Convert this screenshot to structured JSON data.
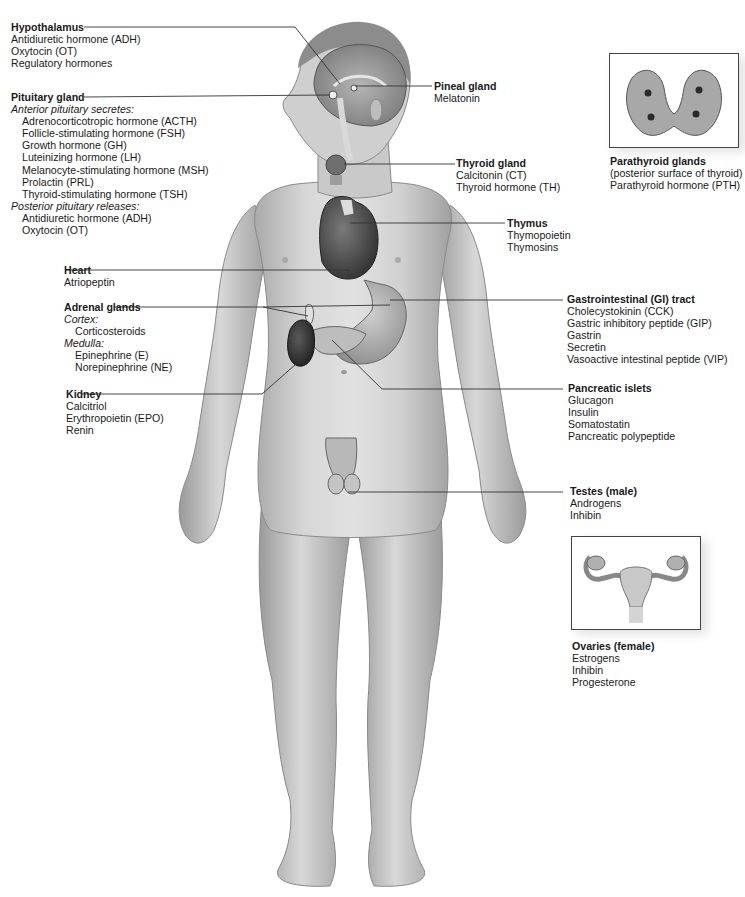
{
  "figure": {
    "type": "anatomical-diagram"
  },
  "glands": {
    "hypothalamus": {
      "title": "Hypothalamus",
      "hormones": [
        "Antidiuretic hormone (ADH)",
        "Oxytocin (OT)",
        "Regulatory hormones"
      ]
    },
    "pituitary": {
      "title": "Pituitary gland",
      "anterior_heading": "Anterior pituitary secretes:",
      "anterior": [
        "Adrenocorticotropic hormone (ACTH)",
        "Follicle-stimulating hormone (FSH)",
        "Growth hormone (GH)",
        "Luteinizing hormone (LH)",
        "Melanocyte-stimulating hormone (MSH)",
        "Prolactin (PRL)",
        "Thyroid-stimulating hormone (TSH)"
      ],
      "posterior_heading": "Posterior pituitary releases:",
      "posterior": [
        "Antidiuretic hormone (ADH)",
        "Oxytocin (OT)"
      ]
    },
    "heart": {
      "title": "Heart",
      "hormones": [
        "Atriopeptin"
      ]
    },
    "adrenal": {
      "title": "Adrenal glands",
      "cortex_heading": "Cortex:",
      "cortex": [
        "Corticosteroids"
      ],
      "medulla_heading": "Medulla:",
      "medulla": [
        "Epinephrine (E)",
        "Norepinephrine (NE)"
      ]
    },
    "kidney": {
      "title": "Kidney",
      "hormones": [
        "Calcitriol",
        "Erythropoietin (EPO)",
        "Renin"
      ]
    },
    "pineal": {
      "title": "Pineal gland",
      "hormones": [
        "Melatonin"
      ]
    },
    "thyroid": {
      "title": "Thyroid gland",
      "hormones": [
        "Calcitonin (CT)",
        "Thyroid hormone (TH)"
      ]
    },
    "thymus": {
      "title": "Thymus",
      "hormones": [
        "Thymopoietin",
        "Thymosins"
      ]
    },
    "parathyroid": {
      "title": "Parathyroid glands",
      "note": "(posterior surface of thyroid)",
      "hormones": [
        "Parathyroid hormone (PTH)"
      ]
    },
    "gi_tract": {
      "title": "Gastrointestinal (GI) tract",
      "hormones": [
        "Cholecystokinin (CCK)",
        "Gastric inhibitory peptide (GIP)",
        "Gastrin",
        "Secretin",
        "Vasoactive intestinal peptide (VIP)"
      ]
    },
    "pancreas": {
      "title": "Pancreatic islets",
      "hormones": [
        "Glucagon",
        "Insulin",
        "Somatostatin",
        "Pancreatic polypeptide"
      ]
    },
    "testes": {
      "title": "Testes (male)",
      "hormones": [
        "Androgens",
        "Inhibin"
      ]
    },
    "ovaries": {
      "title": "Ovaries (female)",
      "hormones": [
        "Estrogens",
        "Inhibin",
        "Progesterone"
      ]
    }
  },
  "colors": {
    "skin_light": "#d9d9d9",
    "skin_mid": "#bdbdbd",
    "skin_dark": "#8e8e8e",
    "organ_dark": "#3a3a3a",
    "leader_line": "#333333",
    "text": "#1a1a1a"
  }
}
